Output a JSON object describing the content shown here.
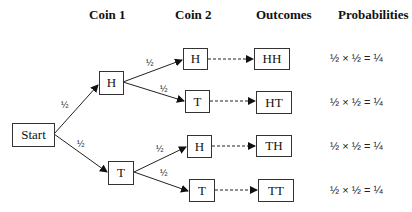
{
  "headers": {
    "coin1": "Coin 1",
    "coin2": "Coin 2",
    "outcomes": "Outcomes",
    "probabilities": "Probabilities"
  },
  "nodes": {
    "start": "Start",
    "coin1_h": "H",
    "coin1_t": "T",
    "coin2_hh": "H",
    "coin2_ht": "T",
    "coin2_th": "H",
    "coin2_tt": "T",
    "out_hh": "HH",
    "out_ht": "HT",
    "out_th": "TH",
    "out_tt": "TT"
  },
  "edge_labels": {
    "start_h": "1/2",
    "start_t": "1/2",
    "h_h": "1/2",
    "h_t": "1/2",
    "t_h": "1/2",
    "t_t": "1/2"
  },
  "probabilities": [
    "½ × ½ = ¼",
    "½ × ½ = ¼",
    "½ × ½ = ¼",
    "½ × ½ = ¼"
  ],
  "edge_label_display": "½"
}
